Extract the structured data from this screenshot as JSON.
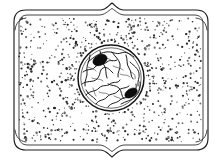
{
  "figure": {
    "kind": "scientific-line-drawing",
    "caption": "",
    "background_color": "#ffffff",
    "ink_color": "#111111",
    "canvas": {
      "width": 224,
      "height": 160
    }
  },
  "structures": {
    "cell_wall": {
      "label": "cell wall",
      "style": "double-line rectangle with rounded corners and central notches",
      "bounds": {
        "x": 10,
        "y": 9,
        "width": 200,
        "height": 142
      },
      "inner_offset": 5,
      "top_notch": "upward peak at x=112",
      "bottom_notch": "downward V at x=112",
      "stroke_color": "#1c1c1c"
    },
    "cytoplasm": {
      "label": "cytoplasm",
      "style": "stippled, dots radiating outward from nucleus in streaming chains",
      "fill_color": "#ffffff",
      "stipple_color": "#2b2b2b",
      "stipple_count": 760
    },
    "nucleus": {
      "label": "nucleus",
      "center": {
        "x": 111,
        "y": 78
      },
      "radius": 33,
      "envelope_stroke": "#141414",
      "contents": "chromatin network (irregular interconnected strands)"
    },
    "nucleoli": [
      {
        "label": "nucleolus",
        "center": {
          "x": 100,
          "y": 60
        },
        "rx": 7.5,
        "ry": 5.2,
        "rotation": -28,
        "fill": "#0d0d0d"
      },
      {
        "label": "nucleolus",
        "center": {
          "x": 131,
          "y": 93
        },
        "rx": 6.8,
        "ry": 4.2,
        "rotation": -32,
        "fill": "#0d0d0d"
      }
    ]
  },
  "chart_data": {
    "type": "table",
    "xlabel": "",
    "ylabel": "",
    "categories": [
      "cell wall",
      "cytoplasm",
      "nucleus",
      "nucleolus 1",
      "nucleolus 2"
    ],
    "values": [
      1,
      1,
      1,
      1,
      1
    ],
    "annotations": [
      "cell wall drawn as double line with rounded corners",
      "cytoplasm rendered as radiating stipple streams",
      "nucleus contains a branching chromatin network",
      "two dense nucleoli inside the nucleus"
    ]
  }
}
